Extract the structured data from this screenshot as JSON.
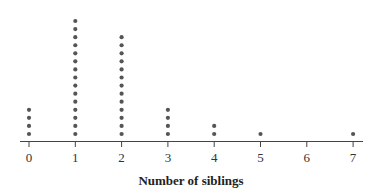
{
  "chart_data": {
    "type": "dot",
    "title": "",
    "xlabel": "Number of siblings",
    "ylabel": "",
    "categories": [
      "0",
      "1",
      "2",
      "3",
      "4",
      "5",
      "6",
      "7"
    ],
    "values": [
      4,
      15,
      13,
      4,
      2,
      1,
      0,
      1
    ],
    "xlim": [
      0,
      7
    ],
    "grid": false,
    "legend": null,
    "colors": {
      "dot": "#555555",
      "axis": "#444444"
    }
  }
}
